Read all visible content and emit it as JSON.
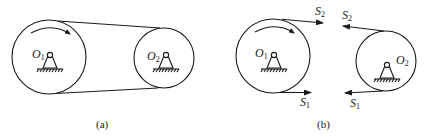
{
  "figure": {
    "panel_a": {
      "caption": "(a)",
      "pulley_driver": {
        "label": "O",
        "subscript": "1"
      },
      "pulley_driven": {
        "label": "O",
        "subscript": "2"
      },
      "rotation": "clockwise"
    },
    "panel_b": {
      "caption": "(b)",
      "pulley_driver": {
        "label": "O",
        "subscript": "1"
      },
      "pulley_driven": {
        "label": "O",
        "subscript": "2"
      },
      "rotation": "clockwise",
      "forces": {
        "tight_left": {
          "label": "S",
          "subscript": "2"
        },
        "slack_left": {
          "label": "S",
          "subscript": "1"
        },
        "tight_right": {
          "label": "S",
          "subscript": "2"
        },
        "slack_right": {
          "label": "S",
          "subscript": "1"
        }
      }
    },
    "colors": {
      "ink": "#1a1a1a",
      "background": "#ffffff"
    }
  }
}
